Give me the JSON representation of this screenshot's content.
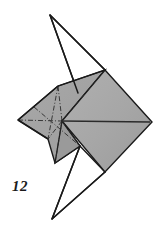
{
  "figure": {
    "kind": "origami-fold-diagram",
    "step_label": "12",
    "background_color": "#ffffff",
    "paper_front_color": "#a8a8a8",
    "paper_shadow_color": "#9a9a9a",
    "paper_back_color": "#ffffff",
    "outline_color": "#1a1a1a",
    "crease_color": "#2b2b2b",
    "outline_width": 1.4,
    "crease_width": 0.9
  },
  "geometry": {
    "canvas": {
      "width": 167,
      "height": 234
    },
    "points": {
      "top_apex": [
        50,
        15
      ],
      "bottom_apex": [
        52,
        219
      ],
      "left_tip": [
        18,
        120
      ],
      "right_tip": [
        152,
        122
      ],
      "diamond_top": [
        105,
        70
      ],
      "diamond_bottom": [
        105,
        172
      ],
      "mid_hub": [
        62,
        121
      ],
      "flap_tip": [
        55,
        163
      ]
    },
    "shapes": {
      "top_spike": "50,15 105,70 78,93",
      "bottom_spike": "52,219 105,172 80,146",
      "body_front": "105,70 152,122 105,172 62,121",
      "body_left": "18,120 58,86 105,70 62,121 80,146 55,163 48,139",
      "flap": "62,121 80,146 55,163"
    },
    "outlines": [
      "50,15 78,93",
      "50,15 105,70",
      "52,219 80,146",
      "52,219 105,172",
      "18,120 58,86 105,70 152,122 105,172 55,163 48,139 18,120"
    ],
    "creases": [
      {
        "from": [
          18,
          120
        ],
        "to": [
          62,
          121
        ],
        "style": "dashdot"
      },
      {
        "from": [
          62,
          121
        ],
        "to": [
          58,
          86
        ],
        "style": "dashdot"
      },
      {
        "from": [
          62,
          121
        ],
        "to": [
          105,
          70
        ],
        "style": "dashdot"
      },
      {
        "from": [
          62,
          121
        ],
        "to": [
          80,
          146
        ],
        "style": "dashdot"
      },
      {
        "from": [
          62,
          121
        ],
        "to": [
          55,
          163
        ],
        "style": "dashdot"
      },
      {
        "from": [
          62,
          121
        ],
        "to": [
          48,
          139
        ],
        "style": "dashdot"
      },
      {
        "from": [
          34,
          107
        ],
        "to": [
          80,
          146
        ],
        "style": "dashdot"
      },
      {
        "from": [
          58,
          86
        ],
        "to": [
          48,
          139
        ],
        "style": "dashdot"
      }
    ],
    "solid_lines": [
      {
        "from": [
          62,
          121
        ],
        "to": [
          150,
          122
        ],
        "width": 1.6
      },
      {
        "from": [
          58,
          86
        ],
        "to": [
          105,
          70
        ],
        "width": 1.2
      }
    ]
  }
}
